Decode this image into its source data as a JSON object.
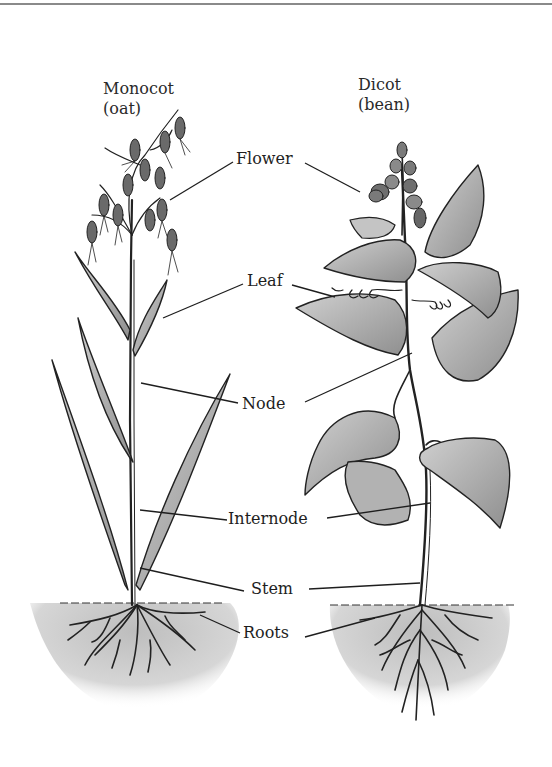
{
  "figure": {
    "type": "labeled botanical illustration"
  },
  "plants": [
    {
      "id": "monocot",
      "title_line1": "Monocot",
      "title_line2": "(oat)"
    },
    {
      "id": "dicot",
      "title_line1": "Dicot",
      "title_line2": "(bean)"
    }
  ],
  "labels": {
    "flower": "Flower",
    "leaf": "Leaf",
    "node": "Node",
    "internode": "Internode",
    "stem": "Stem",
    "roots": "Roots"
  },
  "colors": {
    "ink": "#1e1e1e",
    "leaf_fill": "#a8a8a8",
    "leaf_fill_light": "#c4c4c4",
    "soil": "#d0d0d0",
    "rule": "#8a8a8a"
  }
}
